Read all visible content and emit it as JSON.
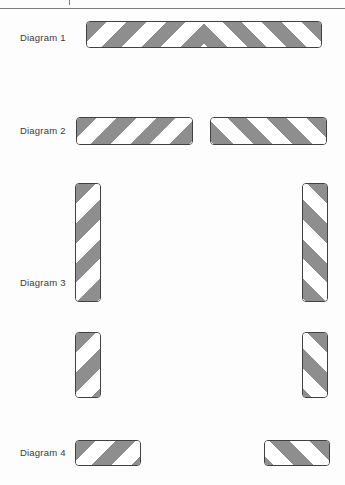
{
  "colors": {
    "stripe_gray": "#8e8e8e",
    "plate_border": "#414141",
    "label_text": "#3a3a3a",
    "rule_gray": "#7d7d7d",
    "page_bg": "#fdfdfd"
  },
  "diagrams": [
    {
      "label": "Diagram 1",
      "plates": [
        "full-width horizontal striped board with centre chevron"
      ]
    },
    {
      "label": "Diagram 2",
      "plates": [
        "left horizontal striped board",
        "right horizontal striped board (mirrored stripes)"
      ]
    },
    {
      "label": "Diagram 3",
      "plates": [
        "left tall vertical striped board",
        "right tall vertical striped board (mirrored stripes)",
        "left short vertical striped board",
        "right short vertical striped board (mirrored stripes)"
      ]
    },
    {
      "label": "Diagram 4",
      "plates": [
        "left small horizontal striped board",
        "right small horizontal striped board (mirrored stripes)"
      ]
    }
  ]
}
